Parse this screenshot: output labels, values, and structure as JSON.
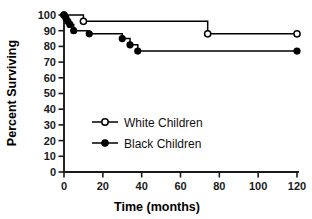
{
  "chart_data": {
    "type": "line",
    "subtype": "kaplan-meier-step",
    "title": "",
    "xlabel": "Time (months)",
    "ylabel": "Percent Surviving",
    "xlim": [
      0,
      120
    ],
    "ylim": [
      0,
      100
    ],
    "xticks": [
      0,
      20,
      40,
      60,
      80,
      100,
      120
    ],
    "yticks": [
      0,
      10,
      20,
      30,
      40,
      50,
      60,
      70,
      80,
      90,
      100
    ],
    "xtick_labels": [
      "0",
      "20",
      "40",
      "60",
      "80",
      "100",
      "120"
    ],
    "ytick_labels": [
      "0",
      "10",
      "20",
      "30",
      "40",
      "50",
      "60",
      "70",
      "80",
      "90",
      "100"
    ],
    "grid": false,
    "legend_position": "center-left",
    "spines": [
      "left",
      "bottom"
    ],
    "series": [
      {
        "name": "White Children",
        "marker": "open-circle",
        "color": "#000000",
        "x": [
          0,
          2,
          10,
          74,
          120
        ],
        "y": [
          100,
          100,
          96,
          88,
          88
        ],
        "event_points": [
          {
            "x": 0,
            "y": 100
          },
          {
            "x": 10,
            "y": 96
          },
          {
            "x": 74,
            "y": 88
          },
          {
            "x": 120,
            "y": 88
          }
        ]
      },
      {
        "name": "Black Children",
        "marker": "filled-circle",
        "color": "#000000",
        "x": [
          0,
          1,
          2,
          3,
          5,
          13,
          30,
          34,
          38,
          120
        ],
        "y": [
          100,
          98,
          96,
          94,
          90,
          88,
          85,
          81,
          77,
          77
        ],
        "event_points": [
          {
            "x": 0,
            "y": 100
          },
          {
            "x": 1,
            "y": 98
          },
          {
            "x": 2,
            "y": 96
          },
          {
            "x": 3,
            "y": 94
          },
          {
            "x": 5,
            "y": 90
          },
          {
            "x": 13,
            "y": 88
          },
          {
            "x": 30,
            "y": 85
          },
          {
            "x": 34,
            "y": 81
          },
          {
            "x": 38,
            "y": 77
          },
          {
            "x": 120,
            "y": 77
          }
        ]
      }
    ]
  },
  "legend": {
    "entries": [
      {
        "label": "White Children",
        "marker": "open-circle"
      },
      {
        "label": "Black Children",
        "marker": "filled-circle"
      }
    ]
  },
  "axes": {
    "x_title": "Time (months)",
    "y_title": "Percent Surviving"
  }
}
